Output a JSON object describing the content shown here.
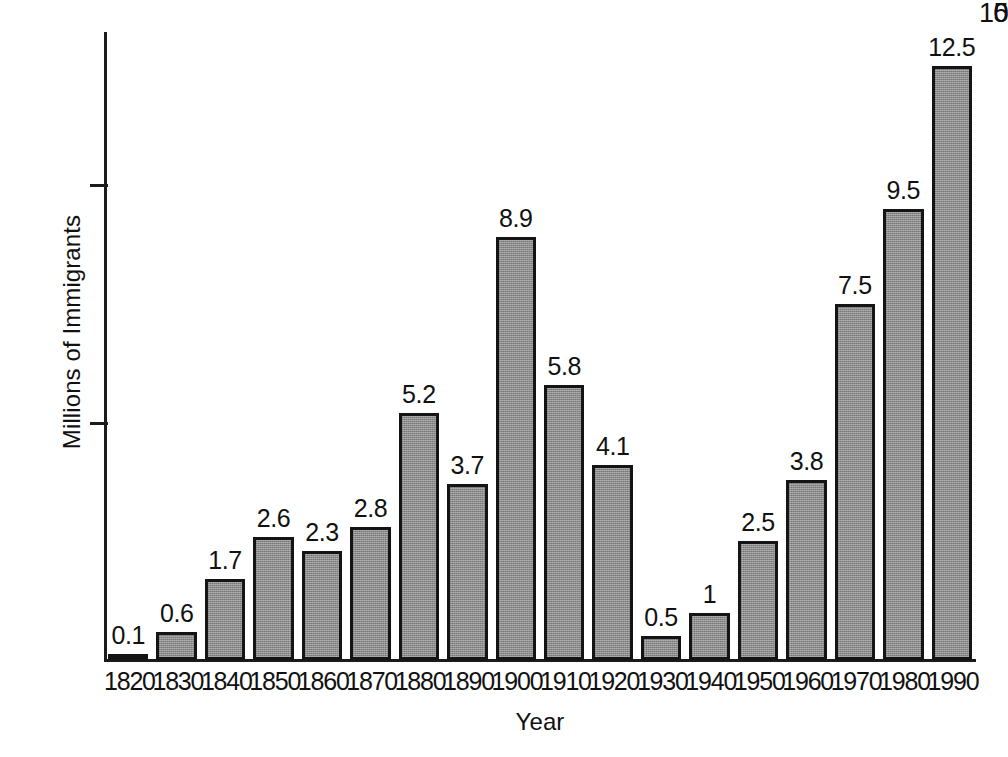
{
  "chart_data": {
    "type": "bar",
    "title": "",
    "xlabel": "Year",
    "ylabel": "Millions of Immigrants",
    "categories": [
      "1820",
      "1830",
      "1840",
      "1850",
      "1860",
      "1870",
      "1880",
      "1890",
      "1900",
      "1910",
      "1920",
      "1930",
      "1940",
      "1950",
      "1960",
      "1970",
      "1980",
      "1990"
    ],
    "values": [
      0.1,
      0.6,
      1.7,
      2.6,
      2.3,
      2.8,
      5.2,
      3.7,
      8.9,
      5.8,
      4.1,
      0.5,
      1,
      2.5,
      3.8,
      7.5,
      9.5,
      12.5
    ],
    "value_labels": [
      "0.1",
      "0.6",
      "1.7",
      "2.6",
      "2.3",
      "2.8",
      "5.2",
      "3.7",
      "8.9",
      "5.8",
      "4.1",
      "0.5",
      "1",
      "2.5",
      "3.8",
      "7.5",
      "9.5",
      "12.5"
    ],
    "ylim": [
      0,
      13.2
    ],
    "y_ticks": [
      0,
      5,
      10
    ],
    "y_tick_labels": [
      "0",
      "5",
      "10"
    ],
    "grid": false,
    "legend": "none",
    "bar_color": "#8b8b8b",
    "bar_border_color": "#141414",
    "axis_color": "#1b1b1b",
    "background_color": "#ffffff",
    "text_color": "#111111"
  }
}
